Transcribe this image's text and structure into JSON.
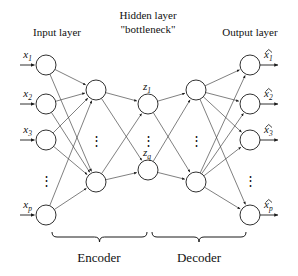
{
  "figure": {
    "type": "autoencoder-neural-network-diagram",
    "titles": {
      "input_layer": "Input layer",
      "hidden_layer_line1": "Hidden layer",
      "hidden_layer_line2": "\"bottleneck\"",
      "output_layer": "Output layer"
    },
    "sections": {
      "encoder": "Encoder",
      "decoder": "Decoder"
    },
    "colors": {
      "background": "#ffffff",
      "stroke": "#1a1a1a",
      "edge": "#3a3a3a",
      "text": "#111111"
    }
  },
  "chart_data": {
    "type": "diagram",
    "layers": [
      {
        "id": "input",
        "name": "Input layer",
        "x": 46,
        "nodes": [
          {
            "label_base": "x",
            "label_sub": "1",
            "y": 65
          },
          {
            "label_base": "x",
            "label_sub": "2",
            "y": 104
          },
          {
            "label_base": "x",
            "label_sub": "3",
            "y": 140
          },
          {
            "label_base": "x",
            "label_sub": "p",
            "y": 215
          }
        ],
        "ellipsis_y": 180
      },
      {
        "id": "encoder-hidden",
        "name": "Encoder hidden layer",
        "x": 96,
        "nodes": [
          {
            "label_base": "",
            "label_sub": "",
            "y": 90
          },
          {
            "label_base": "",
            "label_sub": "",
            "y": 182
          }
        ],
        "ellipsis_y": 140
      },
      {
        "id": "bottleneck",
        "name": "Hidden layer \"bottleneck\"",
        "x": 148,
        "nodes": [
          {
            "label_base": "z",
            "label_sub": "1",
            "y": 104
          },
          {
            "label_base": "z",
            "label_sub": "q",
            "y": 170
          }
        ],
        "ellipsis_y": 140
      },
      {
        "id": "decoder-hidden",
        "name": "Decoder hidden layer",
        "x": 196,
        "nodes": [
          {
            "label_base": "",
            "label_sub": "",
            "y": 90
          },
          {
            "label_base": "",
            "label_sub": "",
            "y": 182
          }
        ],
        "ellipsis_y": 140
      },
      {
        "id": "output",
        "name": "Output layer",
        "x": 250,
        "nodes": [
          {
            "label_base": "x",
            "label_sub": "1",
            "y": 65,
            "hat": true
          },
          {
            "label_base": "x",
            "label_sub": "2",
            "y": 104,
            "hat": true
          },
          {
            "label_base": "x",
            "label_sub": "3",
            "y": 140,
            "hat": true
          },
          {
            "label_base": "x",
            "label_sub": "p",
            "y": 215,
            "hat": true
          }
        ],
        "ellipsis_y": 180
      }
    ],
    "node_radius": 10,
    "edges_description": "fully connected between consecutive visible layers",
    "braces": [
      {
        "label": "Encoder",
        "x_start": 52,
        "x_end": 147,
        "y": 237
      },
      {
        "label": "Decoder",
        "x_start": 152,
        "x_end": 246,
        "y": 237
      }
    ],
    "input_variables": [
      "x1",
      "x2",
      "x3",
      "xp"
    ],
    "latent_variables": [
      "z1",
      "zq"
    ],
    "output_variables": [
      "x1-hat",
      "x2-hat",
      "x3-hat",
      "xp-hat"
    ]
  }
}
